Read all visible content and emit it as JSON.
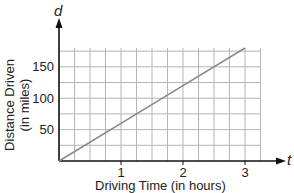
{
  "chart_data": {
    "type": "line",
    "title": "",
    "xlabel": "Driving Time (in hours)",
    "ylabel": "Distance Driven (in miles)",
    "x_axis_variable": "t",
    "y_axis_variable": "d",
    "x_ticks": [
      "1",
      "2",
      "3"
    ],
    "y_ticks": [
      "50",
      "100",
      "150"
    ],
    "xlim": [
      0,
      3.25
    ],
    "ylim": [
      0,
      180
    ],
    "grid": true,
    "grid_x_step": 0.25,
    "grid_y_step": 25,
    "series": [
      {
        "name": "distance",
        "x": [
          0,
          1,
          2,
          3
        ],
        "y": [
          0,
          60,
          120,
          180
        ],
        "color": "#888888"
      }
    ]
  },
  "labels": {
    "x_var": "t",
    "y_var": "d",
    "xlabel": "Driving Time (in hours)",
    "ylabel_line1": "Distance Driven",
    "ylabel_line2": "(in miles)",
    "xt1": "1",
    "xt2": "2",
    "xt3": "3",
    "yt50": "50",
    "yt100": "100",
    "yt150": "150"
  }
}
